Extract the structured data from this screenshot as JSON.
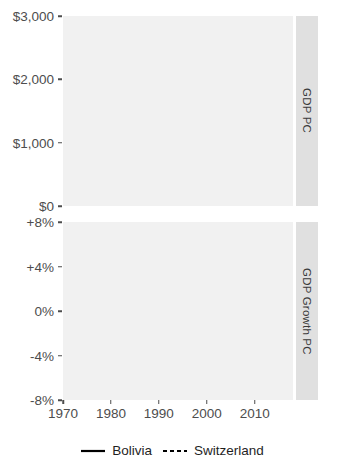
{
  "figure": {
    "background_color": "#ffffff",
    "panel_background_color": "#f1f1f1",
    "strip_background_color": "#e0e0e0",
    "gridline_color": "#ffffff",
    "line_color": "#000000",
    "reference_line_color": "#b3b3b3"
  },
  "panels": {
    "top": {
      "strip_label": "GDP PC",
      "y_ticks": [
        "$3,000",
        "$2,000",
        "$1,000",
        "$0"
      ]
    },
    "bottom": {
      "strip_label": "GDP Growth PC",
      "y_ticks": [
        "+8%",
        "+4%",
        "0%",
        "-4%",
        "-8%"
      ]
    }
  },
  "x_axis": {
    "ticks": [
      "1970",
      "1980",
      "1990",
      "2000",
      "2010"
    ]
  },
  "legend": {
    "items": [
      {
        "label": "Bolivia",
        "style": "solid"
      },
      {
        "label": "Switzerland",
        "style": "dashed"
      }
    ]
  },
  "chart_data": [
    {
      "type": "line",
      "title": "GDP PC",
      "xlabel": "",
      "ylabel": "GDP PC",
      "ylim": [
        0,
        3000
      ],
      "xlim": [
        1970,
        2018
      ],
      "ytick_values": [
        0,
        1000,
        2000,
        3000
      ],
      "ytick_labels": [
        "$0",
        "$1,000",
        "$2,000",
        "$3,000"
      ],
      "xtick_values": [
        1970,
        1980,
        1990,
        2000,
        2010
      ],
      "grid": true,
      "legend_position": "bottom",
      "reference_line": {
        "value": 1780,
        "color": "#b3b3b3",
        "orientation": "horizontal"
      },
      "series": [
        {
          "name": "Bolivia",
          "style": "solid",
          "x": [
            1970,
            1971,
            1972,
            1973,
            1974,
            1975,
            1976,
            1977,
            1978,
            1979,
            1980,
            1981,
            1982,
            1983,
            1984,
            1985,
            1986,
            1987,
            1988,
            1989,
            1990,
            1991,
            1992,
            1993,
            1994,
            1995,
            1996,
            1997,
            1998,
            1999,
            2000,
            2001,
            2002,
            2003,
            2004,
            2005,
            2006,
            2007,
            2008,
            2009,
            2010,
            2011,
            2012,
            2013,
            2014,
            2015,
            2016,
            2017,
            2018
          ],
          "y": [
            1400,
            1430,
            1470,
            1510,
            1555,
            1610,
            1660,
            1700,
            1735,
            1740,
            1725,
            1700,
            1620,
            1540,
            1470,
            1345,
            1295,
            1280,
            1285,
            1305,
            1335,
            1365,
            1370,
            1385,
            1410,
            1430,
            1455,
            1485,
            1500,
            1490,
            1500,
            1495,
            1505,
            1520,
            1555,
            1590,
            1635,
            1680,
            1740,
            1755,
            1800,
            1865,
            1930,
            2000,
            2090,
            2175,
            2250,
            2380,
            2550
          ]
        }
      ]
    },
    {
      "type": "line",
      "title": "GDP Growth PC",
      "xlabel": "",
      "ylabel": "GDP Growth PC",
      "ylim": [
        -8,
        8
      ],
      "xlim": [
        1970,
        2018
      ],
      "ytick_values": [
        -8,
        -4,
        0,
        4,
        8
      ],
      "ytick_labels": [
        "-8%",
        "-4%",
        "0%",
        "+4%",
        "+8%"
      ],
      "xtick_values": [
        1970,
        1980,
        1990,
        2000,
        2010
      ],
      "grid": true,
      "legend_position": "bottom",
      "series": [
        {
          "name": "Bolivia",
          "style": "solid",
          "x": [
            1970,
            1971,
            1972,
            1973,
            1974,
            1975,
            1976,
            1977,
            1978,
            1979,
            1980,
            1981,
            1982,
            1983,
            1984,
            1985,
            1986,
            1987,
            1988,
            1989,
            1990,
            1991,
            1992,
            1993,
            1994,
            1995,
            1996,
            1997,
            1998,
            1999,
            2000,
            2001,
            2002,
            2003,
            2004,
            2005,
            2006,
            2007,
            2008,
            2009,
            2010,
            2011,
            2012,
            2013,
            2014,
            2015,
            2016,
            2017,
            2018
          ],
          "y": [
            2.9,
            5.9,
            2.1,
            2.6,
            3.2,
            6.0,
            3.1,
            2.4,
            2.0,
            0.2,
            -0.9,
            -1.6,
            -4.6,
            -5.7,
            -4.3,
            -2.0,
            -3.8,
            -4.8,
            -1.0,
            1.4,
            2.1,
            2.7,
            -0.1,
            1.9,
            2.3,
            2.1,
            2.6,
            2.7,
            2.8,
            -1.5,
            0.3,
            -0.8,
            0.2,
            0.5,
            1.8,
            2.2,
            3.0,
            2.8,
            4.5,
            1.7,
            2.5,
            3.4,
            3.6,
            5.1,
            3.9,
            2.7,
            2.6,
            2.8,
            2.9
          ]
        },
        {
          "name": "Switzerland",
          "style": "dashed",
          "x": [
            1970,
            1971,
            1972,
            1973,
            1974,
            1975,
            1976,
            1977,
            1978,
            1979,
            1980,
            1981,
            1982,
            1983,
            1984,
            1985,
            1986,
            1987,
            1988,
            1989,
            1990,
            1991,
            1992,
            1993,
            1994,
            1995,
            1996,
            1997,
            1998,
            1999,
            2000,
            2001,
            2002,
            2003,
            2004,
            2005,
            2006,
            2007,
            2008,
            2009,
            2010,
            2011,
            2012,
            2013,
            2014,
            2015,
            2016,
            2017,
            2018
          ],
          "y": [
            2.6,
            2.3,
            2.5,
            1.2,
            -0.1,
            -7.5,
            -2.4,
            1.5,
            0.3,
            2.5,
            3.8,
            1.0,
            -1.8,
            0.2,
            2.7,
            3.1,
            1.6,
            0.2,
            2.7,
            3.5,
            3.0,
            -1.7,
            -1.2,
            -1.1,
            0.3,
            -0.5,
            -0.5,
            1.4,
            2.0,
            0.9,
            3.0,
            0.8,
            -0.4,
            -0.9,
            1.9,
            2.1,
            2.8,
            2.9,
            1.1,
            -3.2,
            0.8,
            0.7,
            -0.1,
            0.7,
            1.2,
            0.3,
            0.7,
            0.9,
            1.9
          ]
        }
      ]
    }
  ]
}
